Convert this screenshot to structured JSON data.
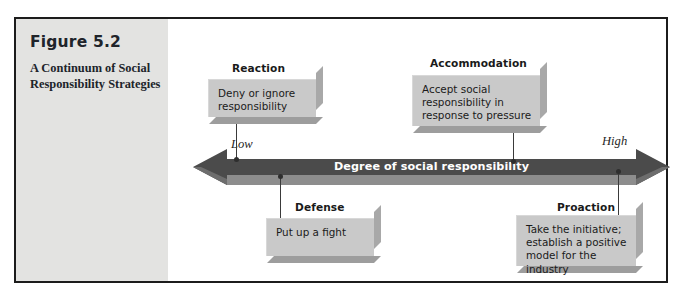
{
  "figure": {
    "number": "Figure 5.2",
    "caption": "A Continuum of Social Responsibility Strategies"
  },
  "continuum": {
    "bar_label": "Degree of social responsibility",
    "low_label": "Low",
    "high_label": "High",
    "bar_color": "#4b4b4b",
    "bar_bevel_color": "#8d8d8d",
    "bar_text_color": "#ffffff"
  },
  "strategies": {
    "reaction": {
      "title": "Reaction",
      "description": "Deny or ignore\nresponsibility"
    },
    "accommodation": {
      "title": "Accommodation",
      "description": "Accept social\nresponsibility in\nresponse to pressure"
    },
    "defense": {
      "title": "Defense",
      "description": "Put up a fight"
    },
    "proaction": {
      "title": "Proaction",
      "description": "Take the initiative;\nestablish a positive\nmodel for the industry"
    }
  },
  "palette": {
    "panel_background": "#e3e3e1",
    "box_face": "#c9c9c9",
    "box_side_shadow": "#a8a8a8",
    "box_bottom_shadow": "#9d9d9d",
    "frame_border": "#1c1c1c",
    "page_background": "#ffffff"
  }
}
